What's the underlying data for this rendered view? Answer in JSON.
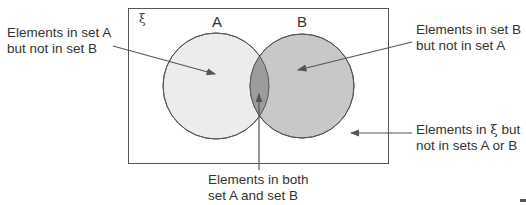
{
  "diagram": {
    "type": "venn",
    "universal_symbol": "ξ",
    "sets": [
      {
        "name": "A",
        "label": "A",
        "fill": "#ececec"
      },
      {
        "name": "B",
        "label": "B",
        "fill": "#c8c8c8"
      }
    ],
    "intersection_fill": "#9c9c9c",
    "frame_color": "#555555",
    "arrow_color": "#555555"
  },
  "labels": {
    "a_only": {
      "line1": "Elements in set A",
      "line2": "but not in set B"
    },
    "b_only": {
      "line1": "Elements in set B",
      "line2": "but not in set A"
    },
    "outside": {
      "line1_pre": "Elements in ",
      "line1_symbol": "ξ",
      "line1_post": " but",
      "line2": "not in sets A or B"
    },
    "both": {
      "line1": "Elements in both",
      "line2": "set A and set B"
    }
  }
}
